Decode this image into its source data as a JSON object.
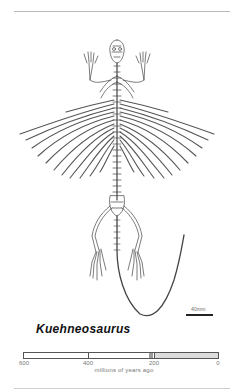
{
  "figure": {
    "species_name": "Kuehneosaurus",
    "illustration": "skeleton of Kuehneosaurus, dorsal view, with elongated rib-supported gliding membrane and long tail",
    "scale_bar_label": "40mm"
  },
  "timeline": {
    "axis_label": "millions of years ago",
    "ticks": [
      "600",
      "400",
      "200",
      "0"
    ],
    "range_min": 0,
    "range_max": 600,
    "highlight_marker_at": 210,
    "shaded_from": 200,
    "shaded_to": 0,
    "colors": {
      "shaded": "#dcdcdc",
      "marker": "#9a9a9a",
      "border": "#555555"
    }
  }
}
